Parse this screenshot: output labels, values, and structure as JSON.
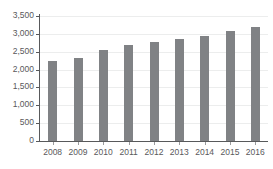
{
  "chart_data": {
    "type": "bar",
    "title": "",
    "subtitle": "",
    "xlabel": "",
    "ylabel": "",
    "categories": [
      "2008",
      "2009",
      "2010",
      "2011",
      "2012",
      "2013",
      "2014",
      "2015",
      "2016"
    ],
    "values": [
      2240,
      2330,
      2540,
      2700,
      2780,
      2870,
      2930,
      3080,
      3190
    ],
    "series": [
      {
        "name": "",
        "values": [
          2240,
          2330,
          2540,
          2700,
          2780,
          2870,
          2930,
          3080,
          3190
        ]
      }
    ],
    "ylim": [
      0,
      3500
    ],
    "ytick_values": [
      0,
      500,
      1000,
      1500,
      2000,
      2500,
      3000,
      3500
    ],
    "ytick_labels": [
      "0",
      "500",
      "1,000",
      "1,500",
      "2,000",
      "2,500",
      "3,000",
      "3,500"
    ],
    "grid": true,
    "grid_axis": "y",
    "legend": false,
    "legend_position": "none",
    "annotations": [],
    "colors": {
      "bar": "#808285",
      "gridline": "#eceded",
      "axis": "#58595b",
      "tick_label": "#59595b",
      "background": "#ffffff"
    }
  }
}
